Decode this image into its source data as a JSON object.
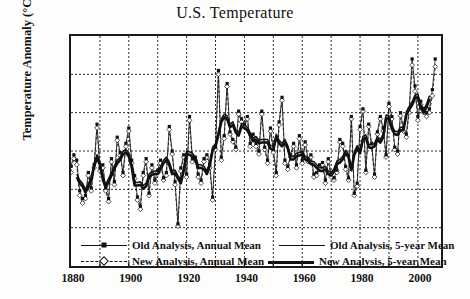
{
  "chart_data": {
    "type": "line",
    "title": "U.S. Temperature",
    "xlabel": "",
    "ylabel": "Temperature Anomaly (°C)",
    "xlim": [
      1880,
      2008
    ],
    "ylim": [
      -1.5,
      1.5
    ],
    "grid": true,
    "grid_style": "dotted",
    "xticks": [
      "1880",
      "1900",
      "1920",
      "1940",
      "1960",
      "1980",
      "2000"
    ],
    "xtick_values": [
      1880,
      1900,
      1920,
      1940,
      1960,
      1980,
      2000
    ],
    "xminor_interval": 10,
    "yticks": [
      "1.5",
      "1.0",
      ".5",
      ".0",
      "-.5",
      "-1.0",
      "-1.5"
    ],
    "ytick_values": [
      1.5,
      1.0,
      0.5,
      0.0,
      -0.5,
      -1.0,
      -1.5
    ],
    "legend_position": "inside-bottom",
    "legend": [
      {
        "label": "Old Analysis, Annual Mean",
        "style": "solid-thin-marker",
        "marker": "filled-square"
      },
      {
        "label": "New Analysis, Annual Mean",
        "style": "dashed-thin-marker",
        "marker": "open-diamond"
      },
      {
        "label": "Old Analysis, 5-year Mean",
        "style": "solid-medium",
        "marker": "none"
      },
      {
        "label": "New Analysis, 5-year Mean",
        "style": "solid-thick",
        "marker": "none"
      }
    ],
    "x": [
      1880,
      1881,
      1882,
      1883,
      1884,
      1885,
      1886,
      1887,
      1888,
      1889,
      1890,
      1891,
      1892,
      1893,
      1894,
      1895,
      1896,
      1897,
      1898,
      1899,
      1900,
      1901,
      1902,
      1903,
      1904,
      1905,
      1906,
      1907,
      1908,
      1909,
      1910,
      1911,
      1912,
      1913,
      1914,
      1915,
      1916,
      1917,
      1918,
      1919,
      1920,
      1921,
      1922,
      1923,
      1924,
      1925,
      1926,
      1927,
      1928,
      1929,
      1930,
      1931,
      1932,
      1933,
      1934,
      1935,
      1936,
      1937,
      1938,
      1939,
      1940,
      1941,
      1942,
      1943,
      1944,
      1945,
      1946,
      1947,
      1948,
      1949,
      1950,
      1951,
      1952,
      1953,
      1954,
      1955,
      1956,
      1957,
      1958,
      1959,
      1960,
      1961,
      1962,
      1963,
      1964,
      1965,
      1966,
      1967,
      1968,
      1969,
      1970,
      1971,
      1972,
      1973,
      1974,
      1975,
      1976,
      1977,
      1978,
      1979,
      1980,
      1981,
      1982,
      1983,
      1984,
      1985,
      1986,
      1987,
      1988,
      1989,
      1990,
      1991,
      1992,
      1993,
      1994,
      1995,
      1996,
      1997,
      1998,
      1999,
      2000,
      2001,
      2002,
      2003,
      2004,
      2005,
      2006
    ],
    "series": [
      {
        "name": "Old Analysis, Annual Mean",
        "style": "solid-thin-marker",
        "values": [
          -0.2,
          -0.05,
          -0.12,
          -0.52,
          -0.62,
          -0.58,
          -0.28,
          -0.48,
          -0.18,
          0.35,
          -0.22,
          -0.18,
          -0.48,
          -0.62,
          -0.1,
          -0.4,
          0.18,
          -0.02,
          -0.28,
          0.1,
          0.3,
          -0.12,
          -0.32,
          -0.6,
          -0.72,
          -0.28,
          -0.1,
          -0.55,
          -0.18,
          -0.38,
          -0.25,
          -0.12,
          -0.35,
          -0.28,
          0.32,
          0.0,
          -0.4,
          -0.95,
          -0.22,
          -0.05,
          -0.3,
          0.45,
          -0.1,
          -0.08,
          -0.3,
          -0.38,
          -0.1,
          -0.05,
          -0.18,
          -0.6,
          0.05,
          1.05,
          -0.08,
          0.2,
          0.88,
          0.25,
          0.15,
          0.05,
          0.52,
          0.42,
          0.35,
          0.45,
          0.1,
          0.22,
          0.1,
          0.0,
          0.52,
          0.05,
          -0.12,
          0.3,
          0.02,
          -0.28,
          0.38,
          0.7,
          -0.12,
          -0.2,
          -0.05,
          0.1,
          -0.18,
          0.2,
          -0.12,
          0.12,
          -0.1,
          -0.05,
          -0.3,
          -0.28,
          -0.18,
          -0.15,
          -0.38,
          -0.1,
          -0.3,
          -0.35,
          -0.25,
          0.15,
          0.1,
          -0.2,
          -0.35,
          0.45,
          -0.55,
          -0.42,
          0.32,
          0.55,
          -0.25,
          0.35,
          0.1,
          -0.3,
          0.25,
          0.45,
          0.3,
          -0.05,
          0.62,
          0.45,
          0.05,
          0.0,
          0.5,
          0.3,
          0.22,
          0.55,
          1.2,
          0.85,
          0.45,
          0.65,
          0.55,
          0.5,
          0.55,
          0.8,
          1.2
        ]
      },
      {
        "name": "New Analysis, Annual Mean",
        "style": "dashed-thin-marker",
        "values": [
          -0.28,
          -0.1,
          -0.18,
          -0.58,
          -0.68,
          -0.62,
          -0.32,
          -0.52,
          -0.22,
          0.3,
          -0.26,
          -0.22,
          -0.52,
          -0.66,
          -0.14,
          -0.44,
          0.14,
          -0.06,
          -0.32,
          0.06,
          0.26,
          -0.16,
          -0.36,
          -0.64,
          -0.76,
          -0.32,
          -0.14,
          -0.58,
          -0.22,
          -0.42,
          -0.28,
          -0.16,
          -0.38,
          -0.32,
          0.28,
          -0.04,
          -0.44,
          -0.98,
          -0.26,
          -0.08,
          -0.34,
          0.4,
          -0.14,
          -0.12,
          -0.34,
          -0.42,
          -0.14,
          -0.08,
          -0.22,
          -0.64,
          0.02,
          1.0,
          -0.12,
          0.16,
          0.84,
          0.22,
          0.12,
          0.02,
          0.48,
          0.38,
          0.32,
          0.42,
          0.06,
          0.18,
          0.06,
          -0.04,
          0.48,
          0.02,
          -0.16,
          0.26,
          -0.02,
          -0.32,
          0.34,
          0.66,
          -0.16,
          -0.24,
          -0.08,
          0.06,
          -0.22,
          0.16,
          -0.16,
          0.08,
          -0.14,
          -0.08,
          -0.34,
          -0.32,
          -0.22,
          -0.18,
          -0.42,
          -0.14,
          -0.34,
          -0.38,
          -0.28,
          0.12,
          0.06,
          -0.24,
          -0.38,
          0.42,
          -0.58,
          -0.46,
          0.28,
          0.52,
          -0.28,
          0.32,
          0.06,
          -0.34,
          0.22,
          0.42,
          0.26,
          -0.08,
          0.58,
          0.42,
          0.02,
          -0.04,
          0.46,
          0.26,
          0.18,
          0.5,
          1.12,
          0.78,
          0.4,
          0.6,
          0.5,
          0.45,
          0.5,
          0.72,
          1.1
        ]
      },
      {
        "name": "Old Analysis, 5-year Mean",
        "style": "solid-medium",
        "values": [
          null,
          null,
          -0.3,
          -0.38,
          -0.42,
          -0.5,
          -0.43,
          -0.34,
          -0.16,
          -0.05,
          -0.14,
          -0.33,
          -0.44,
          -0.36,
          -0.28,
          -0.19,
          -0.12,
          -0.08,
          -0.0,
          0.02,
          -0.03,
          -0.17,
          -0.41,
          -0.41,
          -0.4,
          -0.45,
          -0.42,
          -0.3,
          -0.27,
          -0.26,
          -0.26,
          -0.2,
          -0.12,
          -0.08,
          -0.14,
          -0.26,
          -0.25,
          -0.32,
          -0.38,
          -0.22,
          0.0,
          -0.01,
          -0.03,
          -0.08,
          -0.18,
          -0.18,
          -0.2,
          -0.26,
          -0.15,
          0.05,
          0.1,
          0.25,
          0.42,
          0.48,
          0.46,
          0.35,
          0.38,
          0.28,
          0.24,
          0.36,
          0.34,
          0.31,
          0.24,
          0.17,
          0.19,
          0.14,
          0.15,
          0.15,
          0.15,
          0.07,
          0.06,
          0.22,
          0.14,
          0.1,
          0.15,
          0.07,
          -0.07,
          -0.07,
          -0.03,
          -0.02,
          0.0,
          -0.07,
          -0.09,
          -0.13,
          -0.14,
          -0.18,
          -0.22,
          -0.22,
          -0.2,
          -0.26,
          -0.28,
          -0.23,
          -0.13,
          -0.11,
          -0.07,
          0.01,
          -0.04,
          -0.21,
          -0.01,
          0.07,
          0.01,
          0.19,
          0.21,
          0.09,
          0.08,
          0.1,
          0.19,
          0.15,
          0.22,
          0.47,
          0.46,
          0.33,
          0.26,
          0.25,
          0.31,
          0.31,
          0.51,
          0.58,
          0.64,
          0.73,
          0.74,
          0.6,
          0.54,
          0.61,
          0.72,
          null,
          null
        ]
      },
      {
        "name": "New Analysis, 5-year Mean",
        "style": "solid-thick",
        "values": [
          null,
          null,
          -0.34,
          -0.42,
          -0.46,
          -0.54,
          -0.47,
          -0.38,
          -0.2,
          -0.09,
          -0.18,
          -0.37,
          -0.48,
          -0.4,
          -0.32,
          -0.23,
          -0.16,
          -0.12,
          -0.04,
          -0.02,
          -0.07,
          -0.21,
          -0.45,
          -0.45,
          -0.44,
          -0.49,
          -0.46,
          -0.34,
          -0.31,
          -0.3,
          -0.3,
          -0.24,
          -0.16,
          -0.12,
          -0.18,
          -0.3,
          -0.29,
          -0.36,
          -0.42,
          -0.26,
          -0.04,
          -0.05,
          -0.07,
          -0.12,
          -0.22,
          -0.22,
          -0.24,
          -0.3,
          -0.19,
          0.01,
          0.06,
          0.21,
          0.38,
          0.44,
          0.42,
          0.31,
          0.34,
          0.24,
          0.2,
          0.32,
          0.3,
          0.27,
          0.2,
          0.13,
          0.15,
          0.1,
          0.11,
          0.11,
          0.11,
          0.03,
          0.02,
          0.18,
          0.1,
          0.06,
          0.11,
          0.03,
          -0.11,
          -0.11,
          -0.07,
          -0.06,
          -0.04,
          -0.11,
          -0.13,
          -0.17,
          -0.18,
          -0.22,
          -0.26,
          -0.26,
          -0.24,
          -0.3,
          -0.32,
          -0.27,
          -0.17,
          -0.15,
          -0.11,
          -0.03,
          -0.08,
          -0.25,
          -0.05,
          0.03,
          -0.03,
          0.15,
          0.17,
          0.05,
          0.04,
          0.06,
          0.15,
          0.11,
          0.18,
          0.43,
          0.42,
          0.29,
          0.22,
          0.21,
          0.27,
          0.27,
          0.47,
          0.54,
          0.6,
          0.69,
          0.7,
          0.56,
          0.5,
          0.57,
          0.68,
          null,
          null
        ]
      }
    ]
  }
}
